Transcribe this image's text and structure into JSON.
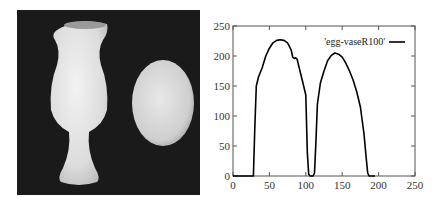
{
  "photo": {
    "description": "Photograph of a white vase and an egg on a dark background",
    "background_color": "#1a1a1a"
  },
  "chart_data": {
    "type": "line",
    "title": "",
    "xlabel": "",
    "ylabel": "",
    "xlim": [
      0,
      250
    ],
    "ylim": [
      0,
      250
    ],
    "xticks": [
      0,
      50,
      100,
      150,
      200,
      250
    ],
    "yticks": [
      0,
      50,
      100,
      150,
      200,
      250
    ],
    "grid": false,
    "legend_position": "upper right",
    "series": [
      {
        "name": "'egg-vaseR100'",
        "color": "#000000",
        "x": [
          0,
          28,
          30,
          32,
          35,
          40,
          45,
          50,
          55,
          60,
          65,
          70,
          75,
          80,
          82,
          84,
          86,
          88,
          90,
          95,
          100,
          102,
          104,
          106,
          108,
          110,
          112,
          114,
          116,
          120,
          125,
          130,
          135,
          140,
          145,
          150,
          155,
          160,
          165,
          170,
          175,
          180,
          183,
          185,
          187,
          195
        ],
        "values": [
          0,
          0,
          80,
          150,
          165,
          180,
          200,
          213,
          222,
          226,
          227,
          226,
          222,
          210,
          198,
          196,
          197,
          195,
          185,
          160,
          135,
          40,
          3,
          0,
          0,
          0,
          5,
          60,
          120,
          155,
          175,
          192,
          201,
          205,
          203,
          198,
          188,
          175,
          160,
          140,
          115,
          70,
          30,
          5,
          0,
          0
        ]
      }
    ]
  }
}
